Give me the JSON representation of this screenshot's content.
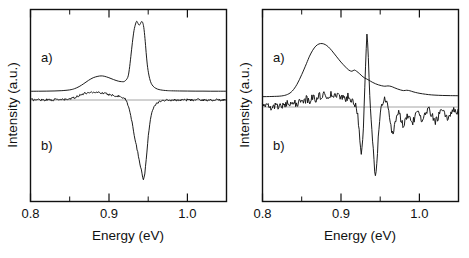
{
  "figure": {
    "panels": [
      {
        "id": "left-panel",
        "name": "left-spectrum-panel",
        "xlabel": "Energy  (eV)",
        "ylabel": "Intensity  (a.u.)",
        "xlim": [
          0.8,
          1.05
        ],
        "major_ticks": [
          0.8,
          0.9,
          1.0
        ],
        "major_tick_labels": [
          "0.8",
          "0.9",
          "1.0"
        ],
        "minor_ticks": [
          0.85,
          0.95,
          1.05
        ],
        "curve_labels": [
          "a)",
          "b)"
        ]
      },
      {
        "id": "right-panel",
        "name": "right-spectrum-panel",
        "xlabel": "Energy  (eV)",
        "ylabel": "Intensity  (a.u.)",
        "xlim": [
          0.8,
          1.05
        ],
        "major_ticks": [
          0.8,
          0.9,
          1.0
        ],
        "major_tick_labels": [
          "0.8",
          "0.9",
          "1.0"
        ],
        "minor_ticks": [
          0.85,
          0.95,
          1.05
        ],
        "curve_labels": [
          "a)",
          "b)"
        ]
      }
    ]
  },
  "chart_data": [
    {
      "type": "line",
      "title": "",
      "panel": "left",
      "xlabel": "Energy  (eV)",
      "ylabel": "Intensity  (a.u.)",
      "xlim": [
        0.8,
        1.05
      ],
      "ylim": [
        0.0,
        1.0
      ],
      "grid": false,
      "legend": "inline-labels",
      "axis_ticks_major": [
        0.8,
        0.9,
        1.0
      ],
      "axis_ticks_minor": [
        0.85,
        0.95,
        1.05
      ],
      "series": [
        {
          "name": "a)",
          "style": "smooth",
          "baseline": 0.0,
          "description": "Photoluminescence: broad band near 0.89 eV with sharp doubled peak near 0.94 eV",
          "x": [
            0.8,
            0.81,
            0.82,
            0.83,
            0.84,
            0.85,
            0.856,
            0.862,
            0.868,
            0.874,
            0.88,
            0.886,
            0.89,
            0.894,
            0.9,
            0.906,
            0.912,
            0.916,
            0.92,
            0.924,
            0.926,
            0.928,
            0.93,
            0.932,
            0.934,
            0.9355,
            0.937,
            0.9385,
            0.94,
            0.9415,
            0.943,
            0.9445,
            0.946,
            0.9475,
            0.949,
            0.951,
            0.953,
            0.955,
            0.958,
            0.962,
            0.966,
            0.97,
            0.975,
            0.98,
            0.99,
            1.0,
            1.01,
            1.02,
            1.03,
            1.04,
            1.05
          ],
          "y": [
            0.022,
            0.023,
            0.024,
            0.026,
            0.03,
            0.04,
            0.055,
            0.082,
            0.12,
            0.162,
            0.196,
            0.214,
            0.219,
            0.215,
            0.196,
            0.172,
            0.152,
            0.146,
            0.15,
            0.2,
            0.3,
            0.47,
            0.65,
            0.8,
            0.885,
            0.92,
            0.895,
            0.87,
            0.885,
            0.915,
            0.905,
            0.84,
            0.7,
            0.52,
            0.36,
            0.23,
            0.15,
            0.105,
            0.072,
            0.05,
            0.04,
            0.034,
            0.03,
            0.028,
            0.026,
            0.025,
            0.024,
            0.024,
            0.023,
            0.023,
            0.023
          ]
        },
        {
          "name": "b)",
          "style": "noisy",
          "baseline": 0.0,
          "description": "Derivative-like / modulated spectrum: weak positive bump near 0.89 eV and deep sharp negative dip at 0.945 eV",
          "x": [
            0.8,
            0.806,
            0.812,
            0.818,
            0.824,
            0.83,
            0.836,
            0.842,
            0.848,
            0.852,
            0.856,
            0.86,
            0.864,
            0.868,
            0.872,
            0.876,
            0.88,
            0.884,
            0.888,
            0.892,
            0.896,
            0.9,
            0.904,
            0.908,
            0.912,
            0.916,
            0.92,
            0.923,
            0.926,
            0.928,
            0.93,
            0.932,
            0.934,
            0.936,
            0.938,
            0.94,
            0.942,
            0.944,
            0.946,
            0.948,
            0.95,
            0.952,
            0.954,
            0.956,
            0.958,
            0.961,
            0.964,
            0.968,
            0.972,
            0.976,
            0.98,
            0.986,
            0.992,
            1.0,
            1.008,
            1.016,
            1.024,
            1.032,
            1.04,
            1.05
          ],
          "y": [
            0.004,
            0.002,
            0.005,
            0.001,
            0.004,
            0.002,
            0.005,
            0.003,
            0.008,
            0.016,
            0.028,
            0.044,
            0.06,
            0.072,
            0.082,
            0.088,
            0.09,
            0.088,
            0.084,
            0.078,
            0.07,
            0.062,
            0.056,
            0.05,
            0.044,
            0.036,
            0.018,
            -0.02,
            -0.1,
            -0.18,
            -0.28,
            -0.38,
            -0.47,
            -0.56,
            -0.65,
            -0.74,
            -0.83,
            -0.9,
            -0.83,
            -0.64,
            -0.43,
            -0.27,
            -0.165,
            -0.1,
            -0.062,
            -0.034,
            -0.018,
            -0.008,
            -0.004,
            -0.002,
            0.0,
            0.001,
            -0.001,
            0.002,
            0.0,
            0.003,
            -0.002,
            0.001,
            0.0,
            0.002
          ]
        }
      ]
    },
    {
      "type": "line",
      "title": "",
      "panel": "right",
      "xlabel": "Energy  (eV)",
      "ylabel": "Intensity  (a.u.)",
      "xlim": [
        0.8,
        1.05
      ],
      "ylim": [
        0.0,
        1.0
      ],
      "grid": false,
      "legend": "inline-labels",
      "axis_ticks_major": [
        0.8,
        0.9,
        1.0
      ],
      "axis_ticks_minor": [
        0.85,
        0.95,
        1.05
      ],
      "series": [
        {
          "name": "a)",
          "style": "smooth",
          "baseline": 0.0,
          "description": "Broad emission peaking near 0.87 eV with shoulders at 0.915, 0.955 and 0.985 eV",
          "x": [
            0.8,
            0.812,
            0.824,
            0.832,
            0.838,
            0.844,
            0.85,
            0.856,
            0.86,
            0.864,
            0.868,
            0.872,
            0.876,
            0.88,
            0.884,
            0.888,
            0.894,
            0.9,
            0.906,
            0.91,
            0.914,
            0.917,
            0.92,
            0.924,
            0.927,
            0.93,
            0.933,
            0.936,
            0.94,
            0.944,
            0.948,
            0.952,
            0.956,
            0.96,
            0.964,
            0.968,
            0.972,
            0.976,
            0.98,
            0.984,
            0.988,
            0.992,
            0.998,
            1.004,
            1.012,
            1.02,
            1.03,
            1.04,
            1.05
          ],
          "y": [
            0.028,
            0.03,
            0.036,
            0.055,
            0.095,
            0.175,
            0.29,
            0.42,
            0.51,
            0.58,
            0.63,
            0.655,
            0.66,
            0.648,
            0.62,
            0.58,
            0.51,
            0.44,
            0.38,
            0.345,
            0.33,
            0.345,
            0.33,
            0.3,
            0.272,
            0.252,
            0.238,
            0.222,
            0.2,
            0.182,
            0.168,
            0.158,
            0.152,
            0.156,
            0.15,
            0.135,
            0.12,
            0.108,
            0.1,
            0.104,
            0.098,
            0.086,
            0.072,
            0.062,
            0.052,
            0.046,
            0.042,
            0.04,
            0.039
          ]
        },
        {
          "name": "b)",
          "style": "noisy",
          "baseline": 0.0,
          "description": "Strongly oscillating modulated spectrum with sharp dip at 0.925, tall positive spike at 0.932 and deepest dip at 0.943 eV",
          "x": [
            0.8,
            0.804,
            0.808,
            0.812,
            0.816,
            0.82,
            0.824,
            0.828,
            0.832,
            0.836,
            0.84,
            0.844,
            0.848,
            0.852,
            0.856,
            0.86,
            0.864,
            0.868,
            0.872,
            0.876,
            0.88,
            0.884,
            0.888,
            0.892,
            0.896,
            0.9,
            0.904,
            0.907,
            0.91,
            0.913,
            0.916,
            0.918,
            0.92,
            0.9215,
            0.923,
            0.9245,
            0.926,
            0.9275,
            0.929,
            0.9305,
            0.932,
            0.9335,
            0.935,
            0.9365,
            0.938,
            0.9395,
            0.941,
            0.9425,
            0.944,
            0.9455,
            0.947,
            0.9485,
            0.95,
            0.952,
            0.954,
            0.956,
            0.958,
            0.96,
            0.962,
            0.964,
            0.966,
            0.968,
            0.97,
            0.973,
            0.976,
            0.979,
            0.982,
            0.985,
            0.988,
            0.991,
            0.994,
            0.997,
            1.0,
            1.004,
            1.008,
            1.012,
            1.016,
            1.02,
            1.024,
            1.028,
            1.032,
            1.036,
            1.04,
            1.044,
            1.048,
            1.05
          ],
          "y": [
            0.01,
            -0.004,
            0.016,
            -0.008,
            0.02,
            -0.002,
            0.026,
            0.01,
            0.04,
            0.018,
            0.056,
            0.034,
            0.078,
            0.052,
            0.1,
            0.074,
            0.124,
            0.098,
            0.146,
            0.118,
            0.16,
            0.132,
            0.152,
            0.124,
            0.14,
            0.112,
            0.124,
            0.098,
            0.15,
            0.09,
            0.06,
            0.03,
            -0.01,
            -0.09,
            -0.24,
            -0.42,
            -0.56,
            -0.46,
            -0.18,
            0.25,
            0.7,
            0.9,
            0.56,
            0.18,
            -0.08,
            -0.26,
            -0.48,
            -0.7,
            -0.88,
            -0.76,
            -0.48,
            -0.24,
            -0.08,
            0.02,
            0.09,
            0.12,
            0.07,
            -0.02,
            -0.14,
            -0.26,
            -0.33,
            -0.26,
            -0.15,
            -0.06,
            -0.13,
            -0.23,
            -0.17,
            -0.09,
            -0.14,
            -0.2,
            -0.13,
            -0.06,
            -0.11,
            -0.17,
            -0.09,
            -0.03,
            -0.1,
            -0.18,
            -0.12,
            -0.04,
            -0.09,
            -0.15,
            -0.08,
            -0.02,
            -0.06,
            -0.03
          ]
        }
      ]
    }
  ]
}
